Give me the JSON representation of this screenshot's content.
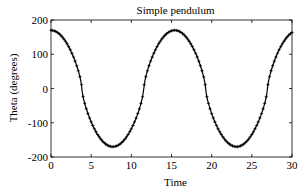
{
  "chart_data": {
    "type": "line",
    "title": "Simple pendulum",
    "xlabel": "Time",
    "ylabel": "Theta (degrees)",
    "xlim": [
      0,
      30
    ],
    "ylim": [
      -200,
      200
    ],
    "xticks": [
      0,
      5,
      10,
      15,
      20,
      25,
      30
    ],
    "yticks": [
      -200,
      -100,
      0,
      100,
      200
    ],
    "grid": false,
    "legend": null,
    "marker": "+",
    "series": [
      {
        "name": "theta",
        "description": "Large-amplitude pendulum oscillation, amplitude ~170 deg, period ~15.4",
        "x": [
          0,
          1,
          2,
          3,
          4,
          5,
          6,
          7,
          7.7,
          9,
          10,
          11,
          12,
          13,
          14,
          15,
          15.4,
          16,
          17,
          18,
          19,
          20,
          21,
          22,
          23.1,
          24,
          25,
          26,
          27,
          28,
          29,
          30
        ],
        "values": [
          170,
          166,
          150,
          115,
          65,
          10,
          -55,
          -140,
          -170,
          -150,
          -105,
          -45,
          20,
          85,
          140,
          166,
          170,
          167,
          150,
          110,
          55,
          -5,
          -75,
          -140,
          -170,
          -160,
          -120,
          -60,
          5,
          70,
          130,
          162
        ]
      }
    ],
    "color": "#000000"
  }
}
